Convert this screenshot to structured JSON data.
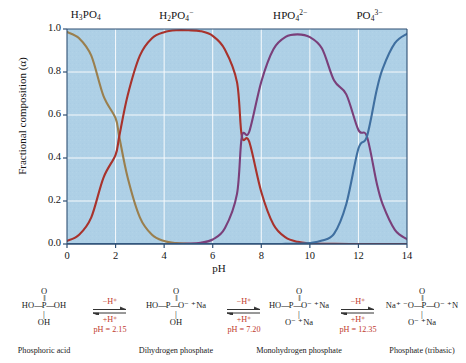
{
  "chart_data": {
    "type": "line",
    "title": "",
    "xlabel": "pH",
    "ylabel": "Fractional composition (α)",
    "xlim": [
      0,
      14
    ],
    "ylim": [
      0,
      1.0
    ],
    "xticks": [
      0,
      2,
      4,
      6,
      8,
      10,
      12,
      14
    ],
    "yticks": [
      "0.0",
      "0.2",
      "0.4",
      "0.6",
      "0.8",
      "1.0"
    ],
    "grid": true,
    "legend_position": "above-curves",
    "plot_background": "#aed0e6",
    "gridline_color": "#ffffff",
    "pKa_values": [
      2.15,
      7.2,
      12.35
    ],
    "annotations": [
      {
        "text": "H3PO4",
        "x": 0.9,
        "note": "curve label above peak"
      },
      {
        "text": "H2PO4-",
        "x": 4.7,
        "note": "curve label above peak"
      },
      {
        "text": "HPO4 2-",
        "x": 9.8,
        "note": "curve label above peak"
      },
      {
        "text": "PO4 3-",
        "x": 13.6,
        "note": "curve label above peak"
      }
    ],
    "series": [
      {
        "name": "H3PO4",
        "color": "#9a7f4e",
        "label_html": "H<sub>3</sub>PO<sub>4</sub>",
        "label_x_pct": 7.0,
        "x": [
          0,
          0.5,
          1,
          1.5,
          2,
          2.15,
          2.5,
          3,
          3.5,
          4,
          4.5,
          5,
          6,
          7,
          8,
          9,
          10,
          11,
          12,
          13,
          14
        ],
        "y": [
          0.986,
          0.957,
          0.876,
          0.689,
          0.585,
          0.5,
          0.308,
          0.124,
          0.043,
          0.014,
          0.004,
          0.0014,
          0.0001,
          0.0,
          0.0,
          0.0,
          0.0,
          0.0,
          0.0,
          0.0,
          0.0
        ]
      },
      {
        "name": "H2PO4-",
        "color": "#a8322c",
        "label_html": "H<sub>2</sub>PO<sub>4</sub><sup>−</sup>",
        "label_x_pct": 33.0,
        "x": [
          0,
          0.5,
          1,
          1.5,
          2,
          2.15,
          2.5,
          3,
          3.5,
          4,
          4.5,
          5,
          5.5,
          6,
          6.5,
          7,
          7.2,
          7.5,
          8,
          8.5,
          9,
          9.5,
          10,
          10.5,
          11,
          12,
          13,
          14
        ],
        "y": [
          0.014,
          0.043,
          0.124,
          0.308,
          0.415,
          0.5,
          0.692,
          0.876,
          0.957,
          0.985,
          0.994,
          0.994,
          0.99,
          0.968,
          0.905,
          0.753,
          0.5,
          0.477,
          0.242,
          0.091,
          0.031,
          0.01,
          0.003,
          0.001,
          0.0004,
          0.0,
          0.0,
          0.0
        ]
      },
      {
        "name": "HPO4 2-",
        "color": "#7a3f7a",
        "label_html": "HPO<sub>4</sub><sup>2−</sup>",
        "label_x_pct": 66.5,
        "x": [
          0,
          2,
          4,
          5,
          5.5,
          6,
          6.5,
          7,
          7.2,
          7.5,
          8,
          8.5,
          9,
          9.5,
          10,
          10.5,
          11,
          11.5,
          12,
          12.35,
          12.75,
          13,
          13.5,
          14
        ],
        "y": [
          0.0,
          0.0,
          0.0001,
          0.002,
          0.006,
          0.021,
          0.073,
          0.233,
          0.5,
          0.521,
          0.755,
          0.906,
          0.963,
          0.975,
          0.962,
          0.909,
          0.76,
          0.696,
          0.53,
          0.5,
          0.285,
          0.184,
          0.066,
          0.022
        ]
      },
      {
        "name": "PO4 3-",
        "color": "#3f6fa0",
        "label_html": "PO<sub>4</sub><sup>3−</sup>",
        "label_x_pct": 91.0,
        "x": [
          0,
          4,
          8,
          9,
          9.5,
          10,
          10.5,
          11,
          11.5,
          12,
          12.35,
          12.75,
          13,
          13.5,
          14
        ],
        "y": [
          0.0,
          0.0,
          0.0,
          0.0005,
          0.0016,
          0.005,
          0.016,
          0.048,
          0.186,
          0.444,
          0.5,
          0.715,
          0.816,
          0.934,
          0.978
        ]
      }
    ]
  },
  "scheme": {
    "species": [
      {
        "id": "phosphoric-acid",
        "name": "Phosphoric acid",
        "top_atom": "O",
        "left_group": "HO",
        "center_atom": "P",
        "right_group": "OH",
        "bottom_group": "OH",
        "right_counterion": "",
        "bottom_counterion": ""
      },
      {
        "id": "dihydrogen-phosphate",
        "name": "Dihydrogen phosphate",
        "top_atom": "O",
        "left_group": "HO",
        "center_atom": "P",
        "right_group": "O⁻",
        "bottom_group": "OH",
        "right_counterion": "⁺Na",
        "bottom_counterion": ""
      },
      {
        "id": "monohydrogen-phosphate",
        "name": "Monohydrogen phosphate",
        "top_atom": "O",
        "left_group": "HO",
        "center_atom": "P",
        "right_group": "O⁻",
        "bottom_group": "O⁻",
        "right_counterion": "⁺Na",
        "bottom_counterion": "⁺Na"
      },
      {
        "id": "phosphate-tribasic",
        "name": "Phosphate (tribasic)",
        "top_atom": "O",
        "left_group": "Na⁺ ⁻O",
        "center_atom": "P",
        "right_group": "O⁻",
        "bottom_group": "O⁻",
        "right_counterion": "⁺N",
        "bottom_counterion": "⁺Na"
      }
    ],
    "arrows": [
      {
        "id": "step-1",
        "forward": "−H⁺",
        "reverse": "+H⁺",
        "ph": "pH = 2.15"
      },
      {
        "id": "step-2",
        "forward": "−H⁺",
        "reverse": "+H⁺",
        "ph": "pH = 7.20"
      },
      {
        "id": "step-3",
        "forward": "−H⁺",
        "reverse": "+H⁺",
        "ph": "pH = 12.35"
      }
    ],
    "accent_color": "#c0392b"
  }
}
